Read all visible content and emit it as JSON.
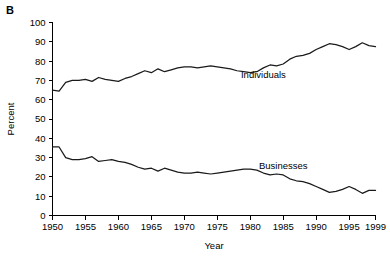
{
  "figure": {
    "panel_letter": "B"
  },
  "chart_data": {
    "type": "line",
    "title": "",
    "xlabel": "Year",
    "ylabel": "Percent",
    "xlim": [
      1950,
      1999
    ],
    "ylim": [
      0,
      100
    ],
    "grid": false,
    "legend_position": "inline-labels",
    "x_ticks": [
      1950,
      1955,
      1960,
      1965,
      1970,
      1975,
      1980,
      1985,
      1990,
      1995,
      1999
    ],
    "x_tick_labels": [
      "1950",
      "1955",
      "1960",
      "1965",
      "1970",
      "1975",
      "1980",
      "1985",
      "1990",
      "1995",
      "1999"
    ],
    "y_ticks": [
      0,
      10,
      20,
      30,
      40,
      50,
      60,
      70,
      80,
      90,
      100
    ],
    "y_tick_labels": [
      "0",
      "10",
      "20",
      "30",
      "40",
      "50",
      "60",
      "70",
      "80",
      "90",
      "100"
    ],
    "x": [
      1950,
      1951,
      1952,
      1953,
      1954,
      1955,
      1956,
      1957,
      1958,
      1959,
      1960,
      1961,
      1962,
      1963,
      1964,
      1965,
      1966,
      1967,
      1968,
      1969,
      1970,
      1971,
      1972,
      1973,
      1974,
      1975,
      1976,
      1977,
      1978,
      1979,
      1980,
      1981,
      1982,
      1983,
      1984,
      1985,
      1986,
      1987,
      1988,
      1989,
      1990,
      1991,
      1992,
      1993,
      1994,
      1995,
      1996,
      1997,
      1998,
      1999
    ],
    "series": [
      {
        "name": "Individuals",
        "label": "Individuals",
        "color": "#1a1a1a",
        "label_x": 1982,
        "label_y": 71,
        "values": [
          65,
          64.5,
          69,
          70,
          70,
          70.5,
          69.5,
          71.5,
          70.5,
          70,
          69.5,
          71,
          72,
          73.5,
          75,
          74,
          76,
          74.5,
          75.5,
          76.5,
          77,
          77,
          76.5,
          77,
          77.5,
          77,
          76.5,
          76,
          75,
          74.5,
          74,
          74.5,
          76.5,
          78,
          77.5,
          78.5,
          81,
          82.5,
          83,
          84,
          86,
          87.5,
          89,
          88.5,
          87.5,
          86,
          87.5,
          89.5,
          88,
          87.5
        ]
      },
      {
        "name": "Businesses",
        "label": "Businesses",
        "color": "#1a1a1a",
        "label_x": 1985,
        "label_y": 24,
        "values": [
          35.5,
          35.5,
          30,
          29,
          29,
          29.5,
          30.5,
          28,
          28.5,
          29,
          28,
          27.5,
          26.5,
          25,
          24,
          24.5,
          23,
          24.5,
          23.5,
          22.5,
          22,
          22,
          22.5,
          22,
          21.5,
          22,
          22.5,
          23,
          23.5,
          24,
          24,
          23.5,
          22,
          21,
          21.5,
          21,
          19,
          18,
          17.5,
          16.5,
          15,
          13.5,
          12,
          12.5,
          13.5,
          15,
          13.5,
          11.5,
          13,
          13
        ]
      }
    ],
    "series_rendered": [
      {
        "name": "Individuals",
        "points": [
          [
            1950,
            64.5
          ],
          [
            1950.6,
            64.5
          ],
          [
            1951.3,
            70.0
          ],
          [
            1952.5,
            69.8
          ],
          [
            1953.4,
            71.5
          ],
          [
            1954.3,
            69.8
          ],
          [
            1955.3,
            71.8
          ],
          [
            1956.4,
            70.0
          ],
          [
            1957.4,
            69.5
          ],
          [
            1958.4,
            72.0
          ],
          [
            1959.4,
            73.5
          ],
          [
            1960.4,
            74.5
          ],
          [
            1961.5,
            76.5
          ],
          [
            1962.5,
            74.5
          ],
          [
            1963.5,
            76.0
          ],
          [
            1964.6,
            76.5
          ],
          [
            1965.6,
            77.5
          ],
          [
            1966.7,
            77.5
          ],
          [
            1967.7,
            77.0
          ],
          [
            1968.7,
            76.0
          ],
          [
            1969.8,
            74.0
          ],
          [
            1970.8,
            73.5
          ],
          [
            1971.9,
            75.0
          ],
          [
            1972.9,
            77.0
          ],
          [
            1973.9,
            76.5
          ],
          [
            1975.0,
            75.5
          ],
          [
            1976.0,
            77.5
          ],
          [
            1977.0,
            82.0
          ],
          [
            1978.1,
            84.5
          ],
          [
            1979.1,
            83.0
          ],
          [
            1980.2,
            82.5
          ],
          [
            1981.2,
            83.0
          ],
          [
            1982.2,
            89.5
          ],
          [
            1983.3,
            90.0
          ],
          [
            1984.3,
            84.0
          ],
          [
            1985.4,
            81.5
          ],
          [
            1986.4,
            81.5
          ],
          [
            1987.4,
            82.0
          ],
          [
            1988.5,
            83.0
          ],
          [
            1989.5,
            82.5
          ],
          [
            1990.6,
            82.0
          ]
        ]
      },
      {
        "name": "Businesses",
        "points": [
          [
            1950,
            35.5
          ],
          [
            1950.7,
            35.5
          ],
          [
            1951.5,
            29.5
          ],
          [
            1952.6,
            28.5
          ],
          [
            1953.5,
            30.5
          ],
          [
            1954.6,
            27.5
          ],
          [
            1955.6,
            27.0
          ],
          [
            1956.6,
            25.5
          ],
          [
            1957.7,
            24.0
          ],
          [
            1958.7,
            25.0
          ],
          [
            1959.7,
            23.0
          ],
          [
            1960.8,
            22.0
          ],
          [
            1961.8,
            21.5
          ],
          [
            1962.9,
            21.5
          ],
          [
            1963.9,
            22.5
          ],
          [
            1964.9,
            23.0
          ],
          [
            1966.0,
            22.0
          ],
          [
            1967.0,
            21.0
          ],
          [
            1968.1,
            21.5
          ],
          [
            1969.1,
            20.5
          ],
          [
            1970.1,
            19.0
          ],
          [
            1971.2,
            17.5
          ],
          [
            1972.2,
            15.0
          ],
          [
            1973.3,
            13.0
          ],
          [
            1974.3,
            13.5
          ],
          [
            1975.3,
            16.0
          ],
          [
            1976.4,
            22.5
          ],
          [
            1977.4,
            23.0
          ],
          [
            1978.5,
            21.5
          ],
          [
            1979.5,
            20.0
          ],
          [
            1980.5,
            20.0
          ]
        ]
      }
    ],
    "annotations": [
      {
        "text": "Individuals",
        "x": 1982,
        "y": 71
      },
      {
        "text": "Businesses",
        "x": 1985,
        "y": 24
      }
    ]
  }
}
